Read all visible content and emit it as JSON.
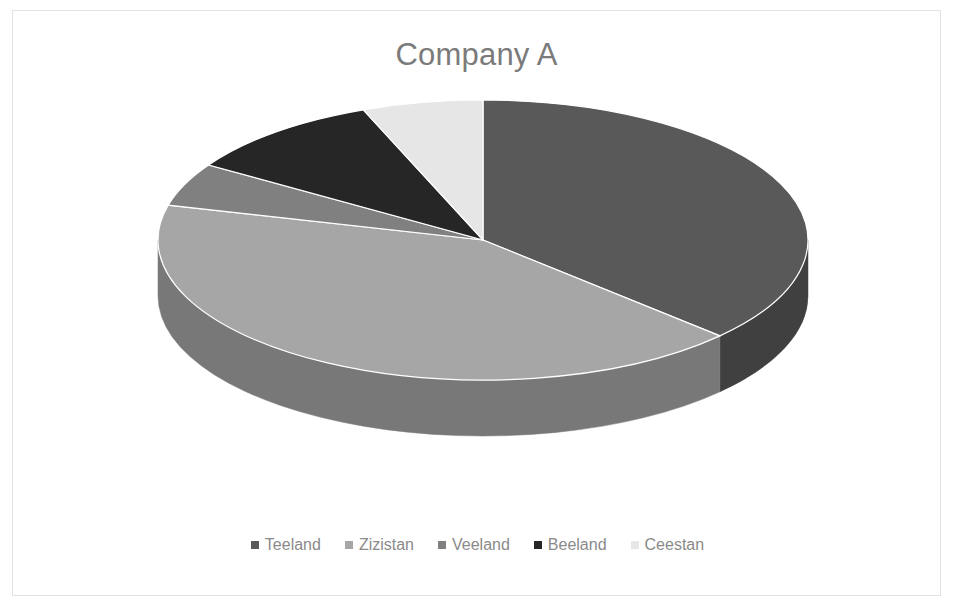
{
  "chart": {
    "title": "Company A",
    "title_color": "#7b7b7b",
    "background": "#ffffff",
    "border_color": "#e2e2e2"
  },
  "legend": {
    "position": "bottom",
    "items": [
      {
        "label": "Teeland",
        "color": "#595959",
        "marker": "square-marker"
      },
      {
        "label": "Zizistan",
        "color": "#a6a6a6",
        "marker": "square-marker"
      },
      {
        "label": "Veeland",
        "color": "#808080",
        "marker": "square-marker"
      },
      {
        "label": "Beeland",
        "color": "#262626",
        "marker": "square-marker"
      },
      {
        "label": "Ceestan",
        "color": "#e6e6e6",
        "marker": "square-marker"
      }
    ]
  },
  "chart_data": {
    "type": "pie",
    "title": "Company A",
    "xlabel": "",
    "ylabel": "",
    "categories": [
      "Teeland",
      "Zizistan",
      "Veeland",
      "Beeland",
      "Ceestan"
    ],
    "values": [
      37,
      42,
      5,
      10,
      6
    ],
    "units": "percent",
    "colors": [
      "#595959",
      "#a6a6a6",
      "#808080",
      "#262626",
      "#e6e6e6"
    ],
    "side_colors": [
      "#404040",
      "#7d7d7d",
      "#5e5e5e",
      "#1a1a1a",
      "#b5b5b5"
    ],
    "start_angle_deg": 0,
    "direction": "clockwise",
    "three_d": true,
    "legend_position": "bottom",
    "grid": false,
    "slices": [
      {
        "name": "Teeland",
        "value": 37,
        "start_deg": 0,
        "end_deg": 133.2,
        "color": "#595959"
      },
      {
        "name": "Zizistan",
        "value": 42,
        "start_deg": 133.2,
        "end_deg": 284.4,
        "color": "#a6a6a6"
      },
      {
        "name": "Veeland",
        "value": 5,
        "start_deg": 284.4,
        "end_deg": 302.4,
        "color": "#808080"
      },
      {
        "name": "Beeland",
        "value": 10,
        "start_deg": 302.4,
        "end_deg": 338.4,
        "color": "#262626"
      },
      {
        "name": "Ceestan",
        "value": 6,
        "start_deg": 338.4,
        "end_deg": 360,
        "color": "#e6e6e6"
      }
    ]
  },
  "geometry": {
    "center_x": 483,
    "center_y": 240,
    "radius_x": 325,
    "radius_y": 140,
    "depth": 56
  }
}
